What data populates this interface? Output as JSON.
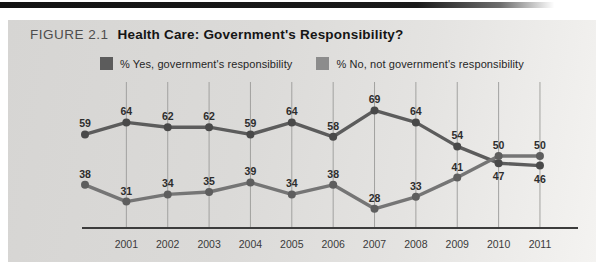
{
  "figure": {
    "label": "FIGURE 2.1",
    "title": "Health Care: Government's Responsibility?"
  },
  "legend": {
    "items": [
      {
        "label": "% Yes, government's responsibility",
        "color": "#5c5c5c"
      },
      {
        "label": "% No, not government's responsibility",
        "color": "#8c8c8c"
      }
    ]
  },
  "chart_data": {
    "type": "line",
    "title": "Health Care: Government's Responsibility?",
    "x": [
      "2000",
      "2001",
      "2002",
      "2003",
      "2004",
      "2005",
      "2006",
      "2007",
      "2008",
      "2009",
      "2010",
      "2011"
    ],
    "x_tick_labels": [
      "",
      "2001",
      "2002",
      "2003",
      "2004",
      "2005",
      "2006",
      "2007",
      "2008",
      "2009",
      "2010",
      "2011"
    ],
    "series": [
      {
        "name": "% Yes, government's responsibility",
        "values": [
          59,
          64,
          62,
          62,
          59,
          64,
          58,
          69,
          64,
          54,
          47,
          46
        ],
        "color": "#5c5c5c",
        "marker_color": "#494949",
        "label_positions": [
          "above",
          "above",
          "above",
          "above",
          "above",
          "above",
          "above",
          "above",
          "above",
          "above",
          "below",
          "below"
        ]
      },
      {
        "name": "% No, not government's responsibility",
        "values": [
          38,
          31,
          34,
          35,
          39,
          34,
          38,
          28,
          33,
          41,
          50,
          50
        ],
        "color": "#757575",
        "marker_color": "#5e5e5e",
        "label_positions": [
          "above",
          "above",
          "above",
          "above",
          "above",
          "above",
          "above",
          "above",
          "above",
          "above",
          "above",
          "above"
        ]
      }
    ],
    "ylim": [
      20,
      80
    ],
    "grid": "vertical-only",
    "legend_position": "top"
  }
}
